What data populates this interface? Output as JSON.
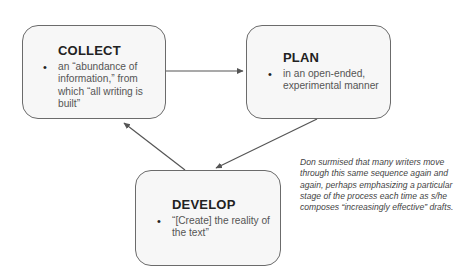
{
  "diagram": {
    "nodes": [
      {
        "id": "collect",
        "title": "COLLECT",
        "bullets": [
          "an “abundance of information,” from which “all writing is built”"
        ]
      },
      {
        "id": "plan",
        "title": "PLAN",
        "bullets": [
          "in an open-ended, experimental manner"
        ]
      },
      {
        "id": "develop",
        "title": "DEVELOP",
        "bullets": [
          "“[Create] the reality of the text”"
        ]
      }
    ],
    "edges": [
      {
        "from": "collect",
        "to": "plan"
      },
      {
        "from": "plan",
        "to": "develop"
      },
      {
        "from": "develop",
        "to": "collect"
      }
    ],
    "note": "Don surmised that many writers move through this same sequence again and again, perhaps emphasizing a particular stage of the process each time as s/he composes “increasingly effective” drafts."
  },
  "colors": {
    "box_fill": "#f7f7f7",
    "box_border": "#6b6b6b",
    "arrow": "#555555",
    "title": "#222222",
    "body_text": "#555555"
  }
}
